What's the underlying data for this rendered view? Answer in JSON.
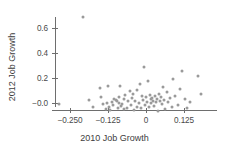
{
  "chart_data": {
    "type": "scatter",
    "title": "",
    "xlabel": "2010 Job Growth",
    "ylabel": "2012 Job Growth",
    "xlim": [
      -0.295,
      0.2
    ],
    "ylim": [
      -0.09,
      0.73
    ],
    "grid": false,
    "legend": null,
    "xticks": [
      -0.25,
      -0.125,
      0,
      0.125
    ],
    "xticklabels": [
      "−0.250",
      "−0.125",
      "0",
      "0.125"
    ],
    "yticks": [
      0.6,
      0.4,
      0.2,
      0.0
    ],
    "yticklabels": [
      "0.6",
      "0.4",
      "0.2",
      "−0.0"
    ],
    "marker": {
      "shape": "circle",
      "color": "#9a9a9a",
      "size_px": 3
    },
    "point_count": 78,
    "points": [
      {
        "x": -0.287,
        "y": -0.005
      },
      {
        "x": -0.208,
        "y": 0.69
      },
      {
        "x": -0.186,
        "y": 0.022
      },
      {
        "x": -0.175,
        "y": -0.033
      },
      {
        "x": -0.152,
        "y": 0.118
      },
      {
        "x": -0.149,
        "y": 0.048
      },
      {
        "x": -0.141,
        "y": -0.01
      },
      {
        "x": -0.132,
        "y": -0.047
      },
      {
        "x": -0.128,
        "y": -0.002
      },
      {
        "x": -0.124,
        "y": 0.137
      },
      {
        "x": -0.121,
        "y": -0.03
      },
      {
        "x": -0.117,
        "y": -0.055
      },
      {
        "x": -0.112,
        "y": 0.01
      },
      {
        "x": -0.108,
        "y": -0.018
      },
      {
        "x": -0.104,
        "y": 0.035
      },
      {
        "x": -0.1,
        "y": 0.028
      },
      {
        "x": -0.097,
        "y": 0.014
      },
      {
        "x": -0.093,
        "y": -0.04
      },
      {
        "x": -0.09,
        "y": 0.052
      },
      {
        "x": -0.088,
        "y": 0.004
      },
      {
        "x": -0.085,
        "y": 0.135
      },
      {
        "x": -0.082,
        "y": -0.025
      },
      {
        "x": -0.078,
        "y": -0.006
      },
      {
        "x": -0.074,
        "y": 0.03
      },
      {
        "x": -0.071,
        "y": -0.05
      },
      {
        "x": -0.068,
        "y": 0.062
      },
      {
        "x": -0.063,
        "y": -0.038
      },
      {
        "x": -0.058,
        "y": 0.016
      },
      {
        "x": -0.054,
        "y": 0.095
      },
      {
        "x": -0.05,
        "y": -0.012
      },
      {
        "x": -0.046,
        "y": 0.044
      },
      {
        "x": -0.043,
        "y": 0.072
      },
      {
        "x": -0.039,
        "y": -0.052
      },
      {
        "x": -0.035,
        "y": 0.02
      },
      {
        "x": -0.031,
        "y": -0.028
      },
      {
        "x": -0.028,
        "y": 0.108
      },
      {
        "x": -0.024,
        "y": 0.002
      },
      {
        "x": -0.02,
        "y": 0.152
      },
      {
        "x": -0.016,
        "y": -0.042
      },
      {
        "x": -0.013,
        "y": 0.058
      },
      {
        "x": -0.01,
        "y": 0.026
      },
      {
        "x": -0.006,
        "y": 0.288
      },
      {
        "x": -0.003,
        "y": -0.018
      },
      {
        "x": 0.0,
        "y": 0.046
      },
      {
        "x": 0.003,
        "y": 0.012
      },
      {
        "x": 0.006,
        "y": 0.178
      },
      {
        "x": 0.009,
        "y": -0.034
      },
      {
        "x": 0.012,
        "y": 0.066
      },
      {
        "x": 0.015,
        "y": 0.03
      },
      {
        "x": 0.018,
        "y": 0.004
      },
      {
        "x": 0.021,
        "y": 0.04
      },
      {
        "x": 0.024,
        "y": 0.02
      },
      {
        "x": 0.027,
        "y": -0.022
      },
      {
        "x": 0.03,
        "y": 0.055
      },
      {
        "x": 0.033,
        "y": 0.008
      },
      {
        "x": 0.036,
        "y": 0.036
      },
      {
        "x": 0.039,
        "y": -0.06
      },
      {
        "x": 0.042,
        "y": 0.07
      },
      {
        "x": 0.045,
        "y": 0.018
      },
      {
        "x": 0.048,
        "y": 0.048
      },
      {
        "x": 0.052,
        "y": -0.01
      },
      {
        "x": 0.056,
        "y": 0.126
      },
      {
        "x": 0.06,
        "y": 0.024
      },
      {
        "x": 0.064,
        "y": -0.048
      },
      {
        "x": 0.068,
        "y": 0.085
      },
      {
        "x": 0.072,
        "y": 0.005
      },
      {
        "x": 0.078,
        "y": 0.042
      },
      {
        "x": 0.084,
        "y": -0.03
      },
      {
        "x": 0.09,
        "y": 0.196
      },
      {
        "x": 0.096,
        "y": 0.06
      },
      {
        "x": 0.104,
        "y": -0.014
      },
      {
        "x": 0.112,
        "y": 0.114
      },
      {
        "x": 0.12,
        "y": 0.255
      },
      {
        "x": 0.128,
        "y": 0.03
      },
      {
        "x": 0.136,
        "y": -0.04
      },
      {
        "x": 0.146,
        "y": 0.012
      },
      {
        "x": 0.172,
        "y": 0.218
      },
      {
        "x": 0.18,
        "y": 0.072
      }
    ],
    "axis": {
      "color": "#6e6e6e",
      "x_pixel_at_zero": 146,
      "x_pixels_per_unit": 304,
      "y_pixel_at_zero": 103,
      "y_pixels_per_unit": 125
    }
  }
}
